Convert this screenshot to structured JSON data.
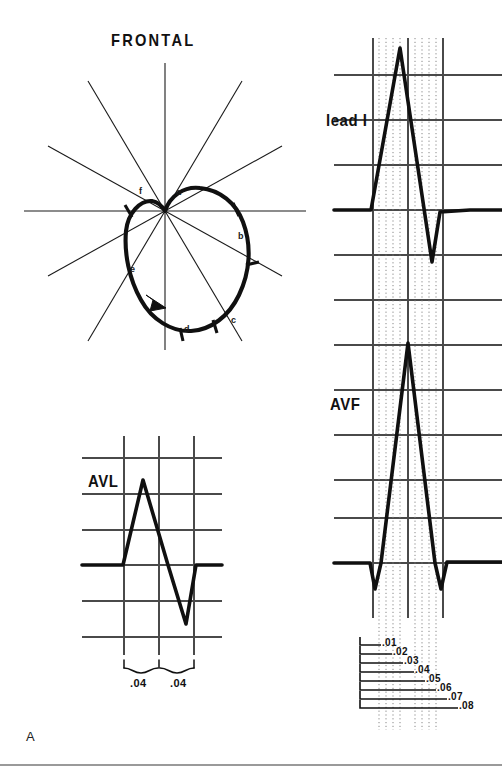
{
  "figure": {
    "panel_letter": "A",
    "title": "FRONTAL",
    "bottom_rule": true
  },
  "vector_loop": {
    "name": "frontal-plane-qrs-loop",
    "center": [
      165,
      211
    ],
    "rotation": "counterclockwise",
    "axis_count": 6,
    "point_labels": [
      {
        "id": "a",
        "text": "a",
        "x": 176,
        "y": 188
      },
      {
        "id": "b",
        "text": "b",
        "x": 238,
        "y": 232
      },
      {
        "id": "c",
        "text": "c",
        "x": 231,
        "y": 316
      },
      {
        "id": "d",
        "text": "d",
        "x": 184,
        "y": 325
      },
      {
        "id": "e",
        "text": "e",
        "x": 130,
        "y": 265
      },
      {
        "id": "f",
        "text": "f",
        "x": 139,
        "y": 187
      }
    ]
  },
  "tracings": [
    {
      "id": "lead-i",
      "label": "lead I",
      "label_x": 326,
      "label_y": 112,
      "baseline_y": 210,
      "r_peak_y": 48,
      "s_trough_y": 262,
      "description": "tall R wave with deep S wave"
    },
    {
      "id": "avf",
      "label": "AVF",
      "label_x": 330,
      "label_y": 396,
      "baseline_y": 563,
      "r_peak_y": 343,
      "q_trough_y": 586,
      "s_trough_y": 589,
      "description": "small q, tall R, small s"
    },
    {
      "id": "avl",
      "label": "AVL",
      "label_x": 88,
      "label_y": 473,
      "baseline_y": 565,
      "r_peak_y": 480,
      "s_trough_y": 624,
      "description": "R wave followed by deep S wave"
    }
  ],
  "avl_braces": [
    {
      "text": ".04",
      "x": 140,
      "y": 682
    },
    {
      "text": ".04",
      "x": 180,
      "y": 682
    }
  ],
  "timing_ladder": {
    "name": "time-scale-ladder",
    "unit": "seconds",
    "steps": [
      {
        "text": ".01",
        "y": 643,
        "x_end": 381
      },
      {
        "text": ".02",
        "y": 652,
        "x_end": 392
      },
      {
        "text": ".03",
        "y": 661,
        "x_end": 403
      },
      {
        "text": ".04",
        "y": 670,
        "x_end": 414
      },
      {
        "text": ".05",
        "y": 679,
        "x_end": 425
      },
      {
        "text": ".06",
        "y": 688,
        "x_end": 436
      },
      {
        "text": ".07",
        "y": 697,
        "x_end": 447
      },
      {
        "text": ".08",
        "y": 706,
        "x_end": 458
      }
    ],
    "x_start": 360
  },
  "colors": {
    "ink": "#111111",
    "grid": "#4a4a4a",
    "dotted": "#777777",
    "rule": "#9a9a9a",
    "background": "#ffffff"
  }
}
